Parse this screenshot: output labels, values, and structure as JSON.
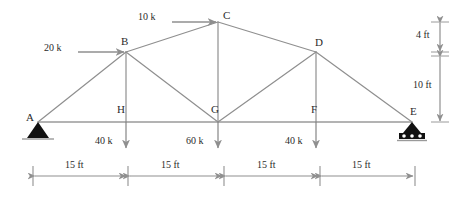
{
  "figure": {
    "type": "truss-free-body-diagram",
    "units": {
      "force": "k",
      "length": "ft"
    },
    "colors": {
      "member": "#8f8f8f",
      "chord": "#9a9a9a",
      "text": "#2b2b2b",
      "arrow": "#8f8f8f",
      "support_fill": "#111111",
      "background": "#ffffff"
    }
  },
  "nodes": [
    {
      "id": "A",
      "label": "A",
      "x": 38,
      "y": 122,
      "label_x": 26,
      "label_y": 112
    },
    {
      "id": "B",
      "label": "B",
      "x": 126,
      "y": 52,
      "label_x": 121,
      "label_y": 36
    },
    {
      "id": "C",
      "label": "C",
      "x": 218,
      "y": 22,
      "label_x": 223,
      "label_y": 10
    },
    {
      "id": "D",
      "label": "D",
      "x": 316,
      "y": 52,
      "label_x": 315,
      "label_y": 37
    },
    {
      "id": "E",
      "label": "E",
      "x": 412,
      "y": 122,
      "label_x": 410,
      "label_y": 106
    },
    {
      "id": "F",
      "label": "F",
      "x": 316,
      "y": 122,
      "label_x": 311,
      "label_y": 104
    },
    {
      "id": "G",
      "label": "G",
      "x": 218,
      "y": 122,
      "label_x": 211,
      "label_y": 104
    },
    {
      "id": "H",
      "label": "H",
      "x": 126,
      "y": 122,
      "label_x": 117,
      "label_y": 104
    }
  ],
  "members": [
    {
      "from": "A",
      "to": "B",
      "kind": "top-chord"
    },
    {
      "from": "B",
      "to": "C",
      "kind": "top-chord"
    },
    {
      "from": "C",
      "to": "D",
      "kind": "top-chord"
    },
    {
      "from": "D",
      "to": "E",
      "kind": "top-chord"
    },
    {
      "from": "A",
      "to": "H",
      "kind": "bottom-chord"
    },
    {
      "from": "H",
      "to": "G",
      "kind": "bottom-chord"
    },
    {
      "from": "G",
      "to": "F",
      "kind": "bottom-chord"
    },
    {
      "from": "F",
      "to": "E",
      "kind": "bottom-chord"
    },
    {
      "from": "B",
      "to": "H",
      "kind": "vertical"
    },
    {
      "from": "C",
      "to": "G",
      "kind": "vertical"
    },
    {
      "from": "D",
      "to": "F",
      "kind": "vertical"
    },
    {
      "from": "B",
      "to": "G",
      "kind": "diagonal"
    },
    {
      "from": "G",
      "to": "D",
      "kind": "diagonal"
    }
  ],
  "supports": [
    {
      "at": "A",
      "type": "pin",
      "name": "pin-support"
    },
    {
      "at": "E",
      "type": "roller",
      "name": "roller-support",
      "rollers": 3
    }
  ],
  "loads": [
    {
      "id": "load-20k-B",
      "label": "20 k",
      "magnitude": 20,
      "unit": "k",
      "at": "B",
      "direction": "right",
      "tail_x": 78,
      "tail_y": 52,
      "head_x": 124,
      "head_y": 52,
      "label_x": 44,
      "label_y": 43
    },
    {
      "id": "load-10k-C",
      "label": "10 k",
      "magnitude": 10,
      "unit": "k",
      "at": "C",
      "direction": "right",
      "tail_x": 172,
      "tail_y": 22,
      "head_x": 216,
      "head_y": 22,
      "label_x": 138,
      "label_y": 12
    },
    {
      "id": "load-40k-H",
      "label": "40 k",
      "magnitude": 40,
      "unit": "k",
      "at": "H",
      "direction": "down",
      "tail_x": 126,
      "tail_y": 122,
      "head_x": 126,
      "head_y": 148,
      "label_x": 95,
      "label_y": 136
    },
    {
      "id": "load-60k-G",
      "label": "60 k",
      "magnitude": 60,
      "unit": "k",
      "at": "G",
      "direction": "down",
      "tail_x": 218,
      "tail_y": 122,
      "head_x": 218,
      "head_y": 148,
      "label_x": 186,
      "label_y": 136
    },
    {
      "id": "load-40k-F",
      "label": "40 k",
      "magnitude": 40,
      "unit": "k",
      "at": "F",
      "direction": "down",
      "tail_x": 316,
      "tail_y": 122,
      "head_x": 316,
      "head_y": 148,
      "label_x": 285,
      "label_y": 136
    }
  ],
  "vertical_dimensions": [
    {
      "id": "dim-4ft",
      "label": "4 ft",
      "value": 4,
      "unit": "ft",
      "x": 440,
      "y_top": 22,
      "y_bottom": 52,
      "label_x": 416,
      "label_y": 30
    },
    {
      "id": "dim-10ft",
      "label": "10 ft",
      "value": 10,
      "unit": "ft",
      "x": 440,
      "y_top": 56,
      "y_bottom": 122,
      "label_x": 413,
      "label_y": 80
    }
  ],
  "horizontal_dimensions": {
    "y_line": 176,
    "tick_top": 166,
    "tick_bottom": 186,
    "spans": [
      {
        "id": "span-A-H",
        "label": "15 ft",
        "value": 15,
        "unit": "ft",
        "x_start": 33,
        "x_end": 128,
        "label_x": 65,
        "label_y": 160
      },
      {
        "id": "span-H-G",
        "label": "15 ft",
        "value": 15,
        "unit": "ft",
        "x_start": 128,
        "x_end": 224,
        "label_x": 161,
        "label_y": 160
      },
      {
        "id": "span-G-F",
        "label": "15 ft",
        "value": 15,
        "unit": "ft",
        "x_start": 224,
        "x_end": 320,
        "label_x": 257,
        "label_y": 160
      },
      {
        "id": "span-F-E",
        "label": "15 ft",
        "value": 15,
        "unit": "ft",
        "x_start": 320,
        "x_end": 415,
        "label_x": 352,
        "label_y": 160
      }
    ]
  }
}
